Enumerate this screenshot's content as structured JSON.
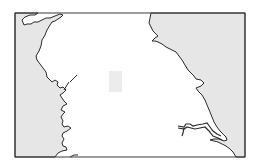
{
  "map": {
    "type": "outline-map",
    "region": "Northern England coastline (blank outline)",
    "labels": [],
    "colors": {
      "sea": "#e6e6e6",
      "land": "#ffffff",
      "coastline": "#2a2a2a",
      "frame": "#3a3a3a",
      "marker": "#ececec",
      "page_background": "#ffffff"
    },
    "frame": {
      "x": 15,
      "y": 13,
      "width": 230,
      "height": 144
    },
    "marker": {
      "x": 109,
      "y": 71,
      "width": 13,
      "height": 21
    }
  }
}
